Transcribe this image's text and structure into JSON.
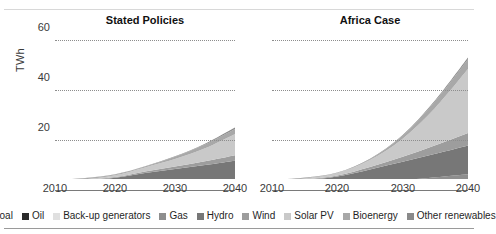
{
  "axis": {
    "y_title": "TWh",
    "y_ticks": [
      "60",
      "40",
      "20"
    ],
    "x_ticks": [
      "2010",
      "2020",
      "2030",
      "2040"
    ]
  },
  "panels": [
    {
      "title": "Stated Policies"
    },
    {
      "title": "Africa Case"
    }
  ],
  "legend": [
    {
      "label": "Coal",
      "color": "#3b3b3b"
    },
    {
      "label": "Oil",
      "color": "#2b2b2b"
    },
    {
      "label": "Back-up generators",
      "color": "#e0e0e0"
    },
    {
      "label": "Gas",
      "color": "#8e8e8e"
    },
    {
      "label": "Hydro",
      "color": "#777777"
    },
    {
      "label": "Wind",
      "color": "#9d9d9d"
    },
    {
      "label": "Solar PV",
      "color": "#c9c9c9"
    },
    {
      "label": "Bioenergy",
      "color": "#a8a8a8"
    },
    {
      "label": "Other renewables",
      "color": "#8a8a8a"
    }
  ],
  "chart_data": {
    "type": "area",
    "title": "",
    "xlabel": "",
    "ylabel": "TWh",
    "xlim": [
      2010,
      2040
    ],
    "ylim": [
      0,
      60
    ],
    "grid": true,
    "legend_position": "bottom",
    "x": [
      2010,
      2015,
      2020,
      2025,
      2030,
      2035,
      2040
    ],
    "panels": [
      {
        "name": "Stated Policies",
        "total": [
          4.0,
          4.8,
          6.3,
          9.5,
          13.5,
          18.5,
          25.0
        ],
        "series": [
          {
            "name": "Coal",
            "color": "#3b3b3b",
            "values": [
              0.15,
              0.15,
              0.2,
              0.3,
              0.4,
              0.5,
              0.6
            ]
          },
          {
            "name": "Oil",
            "color": "#2b2b2b",
            "values": [
              0.2,
              0.25,
              0.5,
              1.0,
              1.1,
              1.2,
              1.3
            ]
          },
          {
            "name": "Back-up generators",
            "color": "#e0e0e0",
            "values": [
              0.1,
              0.1,
              0.1,
              0.15,
              0.2,
              0.2,
              0.25
            ]
          },
          {
            "name": "Gas",
            "color": "#8e8e8e",
            "values": [
              0.3,
              0.35,
              0.5,
              0.8,
              1.1,
              1.5,
              2.0
            ]
          },
          {
            "name": "Hydro",
            "color": "#777777",
            "values": [
              2.6,
              3.0,
              3.6,
              4.6,
              5.6,
              6.6,
              7.6
            ]
          },
          {
            "name": "Wind",
            "color": "#9d9d9d",
            "values": [
              0.05,
              0.15,
              0.3,
              0.6,
              1.0,
              1.5,
              2.2
            ]
          },
          {
            "name": "Solar PV",
            "color": "#c9c9c9",
            "values": [
              0.1,
              0.3,
              0.7,
              1.6,
              3.0,
              5.2,
              8.5
            ]
          },
          {
            "name": "Bioenergy",
            "color": "#a8a8a8",
            "values": [
              0.4,
              0.4,
              0.3,
              0.35,
              0.9,
              1.5,
              2.0
            ]
          },
          {
            "name": "Other renewables",
            "color": "#8a8a8a",
            "values": [
              0.1,
              0.1,
              0.1,
              0.1,
              0.2,
              0.3,
              0.55
            ]
          }
        ]
      },
      {
        "name": "Africa Case",
        "total": [
          4.0,
          5.0,
          7.0,
          12.5,
          22.0,
          36.0,
          53.0
        ],
        "series": [
          {
            "name": "Coal",
            "color": "#3b3b3b",
            "values": [
              0.15,
              0.15,
              0.2,
              0.3,
              0.4,
              0.5,
              0.6
            ]
          },
          {
            "name": "Oil",
            "color": "#2b2b2b",
            "values": [
              0.2,
              0.25,
              0.6,
              1.2,
              1.3,
              1.4,
              1.5
            ]
          },
          {
            "name": "Back-up generators",
            "color": "#e0e0e0",
            "values": [
              0.1,
              0.1,
              0.1,
              0.15,
              0.2,
              0.2,
              0.25
            ]
          },
          {
            "name": "Gas",
            "color": "#8e8e8e",
            "values": [
              0.3,
              0.4,
              0.6,
              1.2,
              2.0,
              3.0,
              4.0
            ]
          },
          {
            "name": "Hydro",
            "color": "#777777",
            "values": [
              2.6,
              3.1,
              3.9,
              5.4,
              7.4,
              9.4,
              11.5
            ]
          },
          {
            "name": "Wind",
            "color": "#9d9d9d",
            "values": [
              0.05,
              0.2,
              0.4,
              1.0,
              2.0,
              3.4,
              5.0
            ]
          },
          {
            "name": "Solar PV",
            "color": "#c9c9c9",
            "values": [
              0.1,
              0.4,
              1.0,
              2.8,
              7.2,
              15.0,
              25.5
            ]
          },
          {
            "name": "Bioenergy",
            "color": "#a8a8a8",
            "values": [
              0.4,
              0.3,
              0.1,
              0.3,
              1.2,
              2.7,
              4.0
            ]
          },
          {
            "name": "Other renewables",
            "color": "#8a8a8a",
            "values": [
              0.1,
              0.1,
              0.1,
              0.15,
              0.3,
              0.4,
              0.65
            ]
          }
        ]
      }
    ]
  }
}
